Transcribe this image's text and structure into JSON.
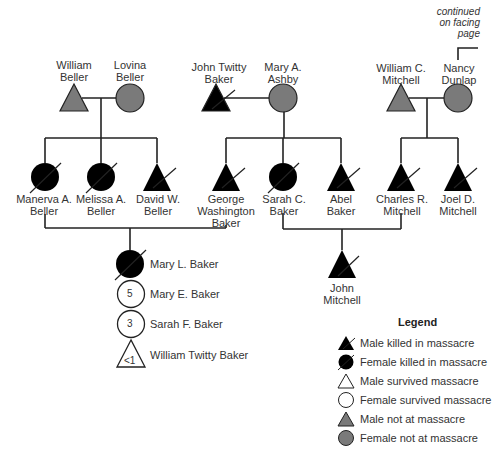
{
  "note": {
    "lines": [
      "continued",
      "on facing",
      "page"
    ]
  },
  "colors": {
    "killed": "#000000",
    "survived": "#ffffff",
    "not_at_massacre": "#7a7a7a",
    "line": "#222222"
  },
  "people": {
    "william_beller": {
      "lines": [
        "William",
        "Beller"
      ],
      "sex": "male",
      "status": "not_at_massacre"
    },
    "lovina_beller": {
      "lines": [
        "Lovina",
        "Beller"
      ],
      "sex": "female",
      "status": "not_at_massacre"
    },
    "john_twitty_baker": {
      "lines": [
        "John Twitty",
        "Baker"
      ],
      "sex": "male",
      "status": "killed"
    },
    "mary_ashby": {
      "lines": [
        "Mary A.",
        "Ashby"
      ],
      "sex": "female",
      "status": "not_at_massacre"
    },
    "william_c_mitchell": {
      "lines": [
        "William C.",
        "Mitchell"
      ],
      "sex": "male",
      "status": "not_at_massacre"
    },
    "nancy_dunlap": {
      "lines": [
        "Nancy",
        "Dunlap"
      ],
      "sex": "female",
      "status": "not_at_massacre"
    },
    "manerva_beller": {
      "lines": [
        "Manerva A.",
        "Beller"
      ],
      "sex": "female",
      "status": "killed"
    },
    "melissa_beller": {
      "lines": [
        "Melissa A.",
        "Beller"
      ],
      "sex": "female",
      "status": "killed"
    },
    "david_beller": {
      "lines": [
        "David W.",
        "Beller"
      ],
      "sex": "male",
      "status": "killed"
    },
    "george_baker": {
      "lines": [
        "George",
        "Washington",
        "Baker"
      ],
      "sex": "male",
      "status": "killed"
    },
    "sarah_c_baker": {
      "lines": [
        "Sarah C.",
        "Baker"
      ],
      "sex": "female",
      "status": "killed"
    },
    "abel_baker": {
      "lines": [
        "Abel",
        "Baker"
      ],
      "sex": "male",
      "status": "killed"
    },
    "charles_mitchell": {
      "lines": [
        "Charles R.",
        "Mitchell"
      ],
      "sex": "male",
      "status": "killed"
    },
    "joel_mitchell": {
      "lines": [
        "Joel D.",
        "Mitchell"
      ],
      "sex": "male",
      "status": "killed"
    },
    "mary_l_baker": {
      "label": "Mary L. Baker",
      "sex": "female",
      "status": "killed"
    },
    "mary_e_baker": {
      "label": "Mary E. Baker",
      "sex": "female",
      "status": "survived",
      "age": "5"
    },
    "sarah_f_baker": {
      "label": "Sarah F. Baker",
      "sex": "female",
      "status": "survived",
      "age": "3"
    },
    "william_twitty_baker": {
      "label": "William Twitty Baker",
      "sex": "male",
      "status": "survived",
      "age": "<1"
    },
    "john_mitchell": {
      "lines": [
        "John",
        "Mitchell"
      ],
      "sex": "male",
      "status": "killed"
    }
  },
  "legend": {
    "title": "Legend",
    "items": [
      {
        "label": "Male killed in massacre",
        "shape": "triangle",
        "status": "killed"
      },
      {
        "label": "Female killed in massacre",
        "shape": "circle",
        "status": "killed"
      },
      {
        "label": "Male survived massacre",
        "shape": "triangle",
        "status": "survived"
      },
      {
        "label": "Female survived massacre",
        "shape": "circle",
        "status": "survived"
      },
      {
        "label": "Male not at massacre",
        "shape": "triangle",
        "status": "not_at_massacre"
      },
      {
        "label": "Female not at massacre",
        "shape": "circle",
        "status": "not_at_massacre"
      }
    ]
  }
}
